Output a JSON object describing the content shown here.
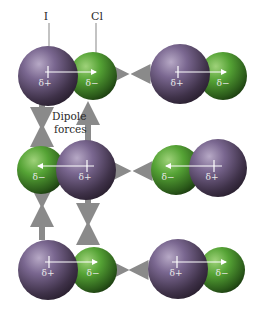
{
  "atom_labels": {
    "iodine": "I",
    "chlorine": "Cl"
  },
  "annotation": {
    "line1": "Dipole",
    "line2": "forces"
  },
  "charges": {
    "positive": "δ+",
    "negative": "δ−"
  },
  "colors": {
    "iodine": "#6e5a80",
    "chlorine": "#4f9a33",
    "force_arrow": "#8a8a8a",
    "dipole_arrow": "#ffffff",
    "background": "#ffffff"
  },
  "molecules": [
    {
      "row": 1,
      "col": 1,
      "orientation": "I-Cl"
    },
    {
      "row": 1,
      "col": 2,
      "orientation": "I-Cl"
    },
    {
      "row": 2,
      "col": 1,
      "orientation": "Cl-I"
    },
    {
      "row": 2,
      "col": 2,
      "orientation": "Cl-I"
    },
    {
      "row": 3,
      "col": 1,
      "orientation": "I-Cl"
    },
    {
      "row": 3,
      "col": 2,
      "orientation": "I-Cl"
    }
  ]
}
